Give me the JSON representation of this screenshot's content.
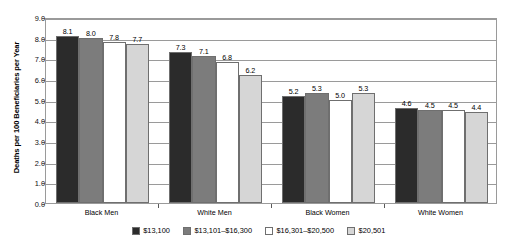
{
  "chart_data": {
    "type": "bar",
    "title": "",
    "xlabel": "",
    "ylabel": "Deaths per 100 Beneficiaries per Year",
    "ylim": [
      0,
      9
    ],
    "ytick_labels": [
      "0.0",
      "1.0",
      "2.0",
      "3.0",
      "4.0",
      "5.0",
      "6.0",
      "7.0",
      "8.0",
      "9.0"
    ],
    "ytick_values": [
      0,
      1,
      2,
      3,
      4,
      5,
      6,
      7,
      8,
      9
    ],
    "grid": true,
    "legend_position": "bottom",
    "categories": [
      "Black Men",
      "White Men",
      "Black Women",
      "White Women"
    ],
    "series": [
      {
        "name": "$13,100",
        "color": "#2b2b2b",
        "values": [
          8.1,
          7.3,
          5.2,
          4.6
        ],
        "labels": [
          "8.1",
          "7.3",
          "5.2",
          "4.6"
        ]
      },
      {
        "name": "$13,101–$16,300",
        "color": "#7c7c7c",
        "values": [
          8.0,
          7.1,
          5.3,
          4.5
        ],
        "labels": [
          "8.0",
          "7.1",
          "5.3",
          "4.5"
        ]
      },
      {
        "name": "$16,301–$20,500",
        "color": "#ffffff",
        "values": [
          7.8,
          6.8,
          5.0,
          4.5
        ],
        "labels": [
          "7.8",
          "6.8",
          "5.0",
          "4.5"
        ]
      },
      {
        "name": "$20,501",
        "color": "#d6d6d6",
        "values": [
          7.7,
          6.2,
          5.3,
          4.4
        ],
        "labels": [
          "7.7",
          "6.2",
          "5.3",
          "4.4"
        ]
      }
    ]
  }
}
